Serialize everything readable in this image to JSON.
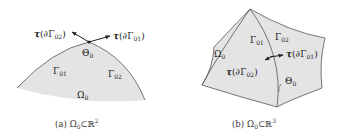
{
  "panel_a": {
    "caption_prefix": "(a)",
    "caption_set": "Ω",
    "caption_set_sub": "0",
    "caption_rel": "⊂ℝ",
    "caption_sup": "2",
    "labels": {
      "tau_left": {
        "sym": "τ",
        "arg": "(∂Γ",
        "sub": "02",
        "close": ")"
      },
      "tau_right": {
        "sym": "τ",
        "arg": "(∂Γ",
        "sub": "01",
        "close": ")"
      },
      "theta": {
        "sym": "Θ",
        "sub": "0"
      },
      "gamma_left": {
        "sym": "Γ",
        "sub": "01"
      },
      "gamma_right": {
        "sym": "Γ",
        "sub": "02"
      },
      "omega": {
        "sym": "Ω",
        "sub": "0"
      }
    }
  },
  "panel_b": {
    "caption_prefix": "(b)",
    "caption_set": "Ω",
    "caption_set_sub": "0",
    "caption_rel": "⊂ℝ",
    "caption_sup": "3",
    "labels": {
      "gamma_left": {
        "sym": "Γ",
        "sub": "01"
      },
      "gamma_right": {
        "sym": "Γ",
        "sub": "02"
      },
      "omega": {
        "sym": "Ω",
        "sub": "0"
      },
      "tau_right": {
        "sym": "τ",
        "arg": "(∂Γ",
        "sub": "01",
        "close": ")"
      },
      "tau_left": {
        "sym": "τ",
        "arg": "(∂Γ",
        "sub": "02",
        "close": ")"
      },
      "theta": {
        "sym": "Θ",
        "sub": "0"
      }
    }
  },
  "colors": {
    "fill": "#e4e4e4",
    "stroke": "#555555",
    "text": "#222222"
  }
}
